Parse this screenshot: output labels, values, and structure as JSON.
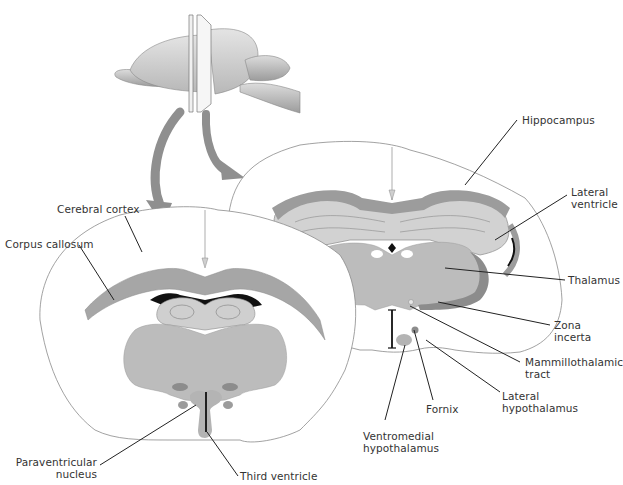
{
  "figure": {
    "colors": {
      "background": "#ffffff",
      "outline": "#8a8a8a",
      "gray_light": "#cfcfcf",
      "gray_mid": "#b4b4b4",
      "gray_dark": "#8c8c8c",
      "black": "#111111",
      "arrow": "#8f8f8f",
      "leader": "#222222",
      "text": "#333333"
    },
    "labels": {
      "hippocampus": "Hippocampus",
      "lateral_ventricle": [
        "Lateral",
        "ventricle"
      ],
      "thalamus": "Thalamus",
      "zona_incerta": [
        "Zona",
        "incerta"
      ],
      "mammillothalamic_tract": [
        "Mammillothalamic",
        "tract"
      ],
      "lateral_hypothalamus": [
        "Lateral",
        "hypothalamus"
      ],
      "fornix": "Fornix",
      "ventromedial_hypothalamus": [
        "Ventromedial",
        "hypothalamus"
      ],
      "cerebral_cortex": "Cerebral cortex",
      "corpus_callosum": "Corpus callosum",
      "paraventricular_nucleus": [
        "Paraventricular",
        "nucleus"
      ],
      "third_ventricle": "Third ventricle"
    }
  }
}
